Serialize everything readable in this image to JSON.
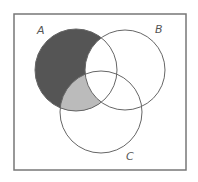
{
  "diagram": {
    "type": "venn",
    "sets": [
      "A",
      "B",
      "C"
    ],
    "labels": {
      "a": "A",
      "b": "B",
      "c": "C"
    },
    "shaded_regions": [
      {
        "region": "A only (not B, not C)",
        "color": "#555555"
      },
      {
        "region": "A ∩ C, not B",
        "color": "#bbbbbb"
      }
    ],
    "colors": {
      "border": "#777777",
      "dark_fill": "#555555",
      "light_fill": "#bbbbbb"
    }
  }
}
